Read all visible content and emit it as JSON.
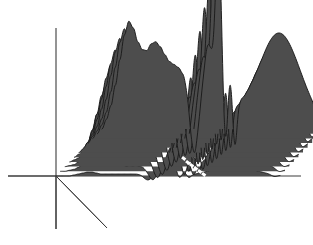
{
  "figure": {
    "title": "",
    "caption": "",
    "watermark": "",
    "background_color": "#ffffff"
  },
  "style": {
    "surface_fill": "#4d4d4d",
    "ridge_line": "#1a1a1a",
    "axis_color": "#3c3c3c",
    "marker_color": "#ffffff"
  },
  "axes": {
    "vertical": {
      "name": "value-axis",
      "x": 56,
      "y_top": 28,
      "y_bottom": 229
    },
    "horizontal": {
      "name": "frequency-axis",
      "y": 176,
      "x_left": 8,
      "x_right": 301
    },
    "depth": {
      "name": "time-axis",
      "x1": 56,
      "y1": 176,
      "x2": 107,
      "y2": 228
    }
  },
  "chart_data": {
    "type": "line",
    "title": "",
    "subtitle": "",
    "xlabel": "",
    "ylabel": "",
    "zlabel": "",
    "grid": false,
    "legend": null,
    "projection": "3d-waterfall",
    "n_traces": 11,
    "depth_offset_x": 4.6,
    "depth_offset_y": 4.7,
    "x": [
      0,
      2,
      4,
      6,
      8,
      10,
      12,
      14,
      16,
      18,
      20,
      22,
      24,
      26,
      28,
      30,
      32,
      34,
      36,
      38,
      40,
      42,
      44,
      46,
      48,
      50,
      52,
      54,
      56,
      58,
      60,
      62,
      64,
      66,
      68,
      70,
      72,
      74,
      76,
      78,
      80,
      82,
      84,
      86,
      88,
      90,
      92,
      94,
      96,
      98,
      100
    ],
    "xlim": [
      0,
      100
    ],
    "ylim": [
      -60,
      170
    ],
    "series": [
      {
        "name": "trace-01",
        "depth_index": 0,
        "values": [
          0,
          0,
          0,
          0,
          1,
          2,
          3,
          4,
          4,
          3,
          2,
          2,
          2,
          2,
          2,
          2,
          2,
          2,
          2,
          2,
          2,
          2,
          1,
          1,
          1,
          1,
          1,
          1,
          0,
          0,
          0,
          0,
          0,
          0,
          0,
          0,
          0,
          0,
          0,
          0,
          0,
          0,
          0,
          0,
          0,
          0,
          0,
          0,
          0,
          0,
          0
        ]
      },
      {
        "name": "trace-02",
        "depth_index": 1,
        "values": [
          0,
          0,
          1,
          2,
          4,
          8,
          12,
          13,
          10,
          7,
          6,
          6,
          7,
          7,
          6,
          5,
          5,
          5,
          5,
          4,
          4,
          3,
          2,
          2,
          2,
          1,
          1,
          1,
          1,
          1,
          1,
          0,
          0,
          0,
          0,
          0,
          0,
          0,
          0,
          0,
          0,
          0,
          0,
          0,
          0,
          0,
          0,
          0,
          0,
          0,
          0
        ]
      },
      {
        "name": "trace-03",
        "depth_index": 2,
        "values": [
          0,
          1,
          2,
          5,
          10,
          18,
          24,
          23,
          18,
          14,
          13,
          14,
          15,
          14,
          12,
          11,
          11,
          11,
          10,
          9,
          8,
          6,
          5,
          4,
          3,
          2,
          2,
          2,
          2,
          2,
          1,
          1,
          1,
          1,
          0,
          0,
          0,
          0,
          0,
          0,
          0,
          0,
          0,
          0,
          0,
          0,
          0,
          0,
          0,
          0,
          0
        ]
      },
      {
        "name": "trace-04",
        "depth_index": 3,
        "values": [
          0,
          2,
          4,
          9,
          18,
          30,
          38,
          36,
          29,
          24,
          23,
          25,
          26,
          24,
          21,
          19,
          19,
          18,
          17,
          15,
          13,
          10,
          8,
          6,
          5,
          4,
          3,
          3,
          3,
          3,
          2,
          2,
          2,
          1,
          1,
          0,
          0,
          0,
          0,
          0,
          0,
          0,
          0,
          0,
          0,
          0,
          0,
          0,
          0,
          0,
          0
        ]
      },
      {
        "name": "trace-05",
        "depth_index": 4,
        "values": [
          0,
          3,
          7,
          15,
          28,
          44,
          54,
          51,
          42,
          36,
          35,
          38,
          39,
          36,
          32,
          29,
          28,
          27,
          25,
          22,
          19,
          15,
          12,
          9,
          7,
          6,
          5,
          5,
          5,
          4,
          4,
          3,
          2,
          2,
          1,
          1,
          0,
          0,
          0,
          0,
          0,
          0,
          0,
          0,
          0,
          0,
          0,
          0,
          0,
          0,
          0
        ]
      },
      {
        "name": "trace-06",
        "depth_index": 5,
        "values": [
          0,
          4,
          10,
          22,
          39,
          58,
          70,
          66,
          55,
          48,
          47,
          51,
          52,
          48,
          43,
          39,
          38,
          36,
          33,
          29,
          25,
          20,
          16,
          12,
          10,
          9,
          8,
          8,
          7,
          6,
          5,
          4,
          3,
          2,
          2,
          1,
          0,
          0,
          0,
          0,
          0,
          0,
          0,
          0,
          0,
          0,
          0,
          0,
          0,
          0,
          0
        ]
      },
      {
        "name": "trace-07",
        "depth_index": 6,
        "values": [
          0,
          6,
          14,
          29,
          50,
          71,
          84,
          79,
          67,
          59,
          58,
          63,
          64,
          60,
          54,
          49,
          47,
          45,
          41,
          36,
          31,
          25,
          20,
          16,
          14,
          13,
          12,
          11,
          10,
          8,
          7,
          5,
          4,
          3,
          2,
          1,
          0,
          0,
          0,
          0,
          0,
          0,
          0,
          0,
          0,
          0,
          0,
          0,
          0,
          0,
          0
        ]
      },
      {
        "name": "trace-08",
        "depth_index": 7,
        "values": [
          0,
          7,
          17,
          35,
          58,
          81,
          95,
          89,
          76,
          68,
          67,
          73,
          74,
          69,
          63,
          57,
          55,
          52,
          47,
          42,
          36,
          30,
          24,
          20,
          18,
          17,
          16,
          15,
          13,
          11,
          9,
          7,
          5,
          3,
          2,
          1,
          0,
          0,
          0,
          0,
          0,
          0,
          0,
          0,
          0,
          0,
          0,
          0,
          0,
          0,
          0
        ]
      },
      {
        "name": "trace-09",
        "depth_index": 8,
        "values": [
          0,
          8,
          20,
          40,
          64,
          88,
          102,
          96,
          82,
          74,
          73,
          79,
          81,
          76,
          69,
          63,
          60,
          57,
          52,
          46,
          40,
          34,
          28,
          24,
          22,
          21,
          20,
          18,
          16,
          13,
          11,
          8,
          6,
          4,
          2,
          1,
          0,
          0,
          0,
          0,
          0,
          0,
          0,
          0,
          0,
          0,
          0,
          0,
          0,
          0,
          0
        ]
      },
      {
        "name": "trace-10",
        "depth_index": 9,
        "values": [
          0,
          9,
          22,
          43,
          68,
          93,
          107,
          100,
          86,
          78,
          77,
          84,
          86,
          81,
          74,
          67,
          64,
          61,
          56,
          50,
          44,
          37,
          31,
          27,
          25,
          24,
          22,
          20,
          18,
          15,
          12,
          9,
          7,
          4,
          2,
          1,
          0,
          0,
          0,
          0,
          0,
          0,
          0,
          0,
          0,
          0,
          0,
          0,
          0,
          0,
          0
        ]
      },
      {
        "name": "trace-11",
        "depth_index": 10,
        "values": [
          0,
          10,
          24,
          45,
          71,
          96,
          110,
          103,
          89,
          81,
          80,
          87,
          89,
          84,
          76,
          69,
          66,
          63,
          58,
          52,
          46,
          39,
          33,
          29,
          27,
          26,
          24,
          22,
          19,
          16,
          13,
          10,
          7,
          5,
          3,
          1,
          0,
          0,
          0,
          0,
          0,
          0,
          0,
          0,
          0,
          0,
          0,
          0,
          0,
          0,
          0
        ]
      }
    ],
    "annotations": [
      {
        "name": "central-spike",
        "x_px": 177,
        "peak_y_px": 12,
        "description": "tall narrow positive spike"
      },
      {
        "name": "negative-trough-left",
        "x_px": 145,
        "y_px": 228,
        "description": "deep negative excursion"
      },
      {
        "name": "negative-trough-right",
        "x_px": 190,
        "y_px": 230,
        "description": "deep negative excursion"
      },
      {
        "name": "right-dome",
        "x_px": 240,
        "y_px": 97,
        "description": "broad nested arch family"
      }
    ],
    "markers": {
      "name": "white-dash-marker",
      "color": "#ffffff",
      "count": 6,
      "points_px": [
        [
          183,
          156
        ],
        [
          187,
          160
        ],
        [
          191,
          163
        ],
        [
          195,
          166
        ],
        [
          199,
          169
        ],
        [
          203,
          172
        ]
      ]
    }
  }
}
